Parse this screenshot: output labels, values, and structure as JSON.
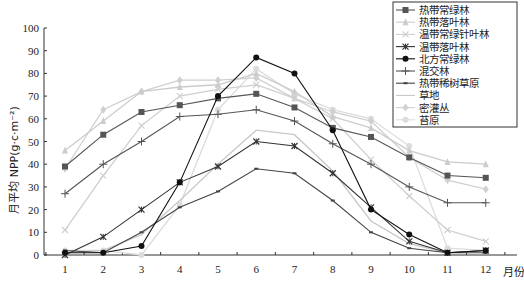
{
  "chart_data": {
    "type": "line",
    "title": "",
    "xlabel": "月份",
    "ylabel": "月平均 NPP(g·c·m⁻²)",
    "ylim": [
      0,
      100
    ],
    "yticks": [
      0,
      10,
      20,
      30,
      40,
      50,
      60,
      70,
      80,
      90,
      100
    ],
    "x": [
      1,
      2,
      3,
      4,
      5,
      6,
      7,
      8,
      9,
      10,
      11,
      12
    ],
    "categories": [
      "1",
      "2",
      "3",
      "4",
      "5",
      "6",
      "7",
      "8",
      "9",
      "10",
      "11",
      "12"
    ],
    "grid": false,
    "legend_position": "upper right",
    "series": [
      {
        "name": "热带常绿林",
        "marker": "square",
        "color": "#555555",
        "values": [
          39,
          53,
          63,
          66,
          69,
          71,
          65,
          56,
          52,
          43,
          35,
          34
        ]
      },
      {
        "name": "热带落叶林",
        "marker": "triangle",
        "color": "#cccccc",
        "values": [
          46,
          59,
          72,
          74,
          75,
          80,
          72,
          61,
          56,
          46,
          41,
          40
        ]
      },
      {
        "name": "温带常绿针叶林",
        "marker": "x",
        "color": "#cfcfcf",
        "values": [
          11,
          35,
          57,
          70,
          73,
          75,
          69,
          60,
          42,
          26,
          11,
          6
        ]
      },
      {
        "name": "温带落叶林",
        "marker": "star",
        "color": "#333333",
        "values": [
          0,
          8,
          20,
          32,
          39,
          50,
          48,
          36,
          21,
          6,
          1,
          2
        ]
      },
      {
        "name": "北方常绿林",
        "marker": "circle",
        "color": "#111111",
        "values": [
          1,
          1,
          4,
          32,
          70,
          87,
          80,
          55,
          20,
          9,
          1,
          2
        ]
      },
      {
        "name": "混交林",
        "marker": "plus",
        "color": "#555555",
        "values": [
          27,
          40,
          50,
          61,
          62,
          64,
          59,
          49,
          40,
          30,
          23,
          23
        ]
      },
      {
        "name": "热带稀树草原",
        "marker": "dash",
        "color": "#444444",
        "values": [
          2,
          1,
          10,
          21,
          28,
          38,
          36,
          24,
          10,
          3,
          1,
          1
        ]
      },
      {
        "name": "草地",
        "marker": "none",
        "color": "#c8c8c8",
        "values": [
          1,
          2,
          9,
          24,
          40,
          55,
          53,
          37,
          15,
          5,
          1,
          2
        ]
      },
      {
        "name": "密灌丛",
        "marker": "diamond",
        "color": "#d0d0d0",
        "values": [
          38,
          64,
          72,
          77,
          77,
          78,
          69,
          63,
          59,
          43,
          33,
          29
        ]
      },
      {
        "name": "苔原",
        "marker": "circle",
        "color": "#dcdcdc",
        "values": [
          2,
          2,
          0,
          22,
          64,
          82,
          71,
          64,
          60,
          48,
          3,
          2
        ]
      }
    ]
  },
  "axes": {
    "x_title": "月份",
    "y_title": "月平均 NPP(g·c·m⁻²)"
  }
}
